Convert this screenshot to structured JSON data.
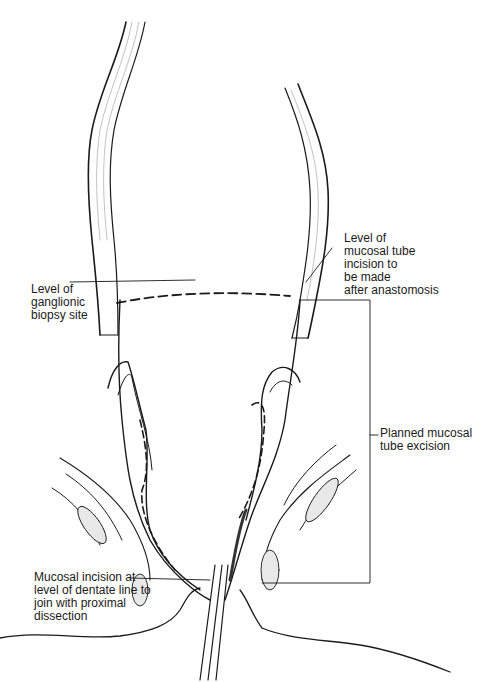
{
  "figure": {
    "type": "surgical illustration",
    "colors": {
      "ink": "#1a1a1a",
      "shading": "#888888",
      "background": "#ffffff"
    }
  },
  "labels": {
    "ganglionic_biopsy": "Level of\nganglionic\nbiopsy site",
    "mucosal_tube_incision": "Level of\nmucosal tube\nincision to\nbe made\nafter anastomosis",
    "planned_excision": "Planned mucosal\ntube excision",
    "dentate_incision": "Mucosal incision at\nlevel of dentate line to\njoin with proximal\ndissection"
  }
}
